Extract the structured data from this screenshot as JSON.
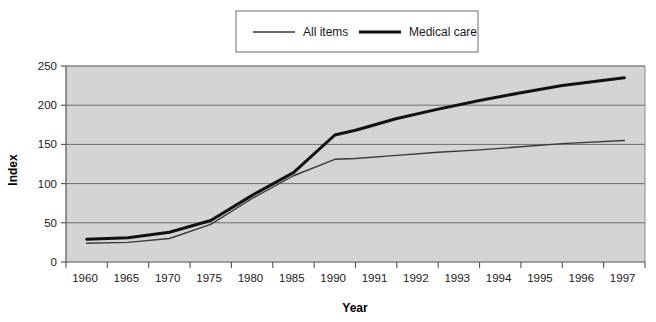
{
  "chart_data": {
    "type": "line",
    "title": "",
    "xlabel": "Year",
    "ylabel": "Index",
    "categories": [
      "1960",
      "1965",
      "1970",
      "1975",
      "1980",
      "1985",
      "1990",
      "1991",
      "1992",
      "1993",
      "1994",
      "1995",
      "1996",
      "1997"
    ],
    "ylim": [
      0,
      250
    ],
    "yticks": [
      0,
      50,
      100,
      150,
      200,
      250
    ],
    "grid": "horizontal",
    "legend_position": "top-center",
    "plot_background": "#d4d4d4",
    "series": [
      {
        "name": "All items",
        "color": "#3a3a3a",
        "line_width": 1.4,
        "x": [
          1962.5,
          1967.5,
          1972.5,
          1977.5,
          1982.5,
          1987.5,
          1990.5,
          1991,
          1992,
          1993,
          1994,
          1995,
          1996,
          1997.5
        ],
        "values": [
          24,
          25,
          30,
          48,
          81,
          110,
          131,
          132,
          136,
          140,
          143,
          147,
          151,
          155
        ]
      },
      {
        "name": "Medical care",
        "color": "#111111",
        "line_width": 3.0,
        "x": [
          1962.5,
          1967.5,
          1972.5,
          1977.5,
          1982.5,
          1987.5,
          1990.5,
          1991,
          1992,
          1993,
          1994,
          1995,
          1996,
          1997.5
        ],
        "values": [
          29,
          31,
          38,
          53,
          85,
          114,
          162,
          168,
          183,
          195,
          206,
          216,
          225,
          235
        ]
      }
    ]
  },
  "legend": {
    "items": [
      {
        "label": "All items",
        "style": "thin"
      },
      {
        "label": "Medical care",
        "style": "thick"
      }
    ]
  },
  "axes": {
    "y_title": "Index",
    "x_title": "Year",
    "y_tick_labels": [
      "0",
      "50",
      "100",
      "150",
      "200",
      "250"
    ],
    "x_tick_labels": [
      "1960",
      "1965",
      "1970",
      "1975",
      "1980",
      "1985",
      "1990",
      "1991",
      "1992",
      "1993",
      "1994",
      "1995",
      "1996",
      "1997"
    ]
  }
}
